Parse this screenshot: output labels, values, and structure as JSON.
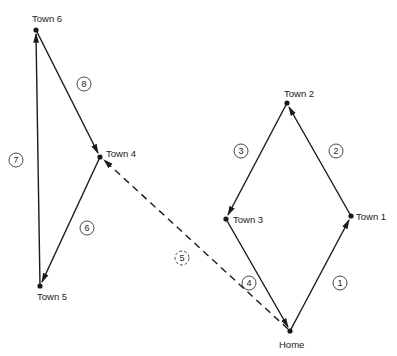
{
  "diagram": {
    "title": "",
    "colors": {
      "line": "#1a1a1a",
      "text": "#222222",
      "background": "#ffffff"
    },
    "nodes": [
      {
        "id": "home",
        "label": "Home",
        "x": 290,
        "y": 331
      },
      {
        "id": "town1",
        "label": "Town 1",
        "x": 351,
        "y": 216
      },
      {
        "id": "town2",
        "label": "Town 2",
        "x": 287,
        "y": 103
      },
      {
        "id": "town3",
        "label": "Town 3",
        "x": 226,
        "y": 219
      },
      {
        "id": "town4",
        "label": "Town 4",
        "x": 100,
        "y": 157
      },
      {
        "id": "town5",
        "label": "Town 5",
        "x": 40,
        "y": 286
      },
      {
        "id": "town6",
        "label": "Town 6",
        "x": 36,
        "y": 30
      }
    ],
    "edges": [
      {
        "step": "1",
        "from": "home",
        "to": "town1",
        "style": "solid"
      },
      {
        "step": "2",
        "from": "town1",
        "to": "town2",
        "style": "solid"
      },
      {
        "step": "3",
        "from": "town2",
        "to": "town3",
        "style": "solid"
      },
      {
        "step": "4",
        "from": "town3",
        "to": "home",
        "style": "solid"
      },
      {
        "step": "5",
        "from": "home",
        "to": "town4",
        "style": "dashed"
      },
      {
        "step": "6",
        "from": "town4",
        "to": "town5",
        "style": "solid"
      },
      {
        "step": "7",
        "from": "town5",
        "to": "town6",
        "style": "solid"
      },
      {
        "step": "8",
        "from": "town6",
        "to": "town4",
        "style": "solid"
      }
    ],
    "step_labels": {
      "s1": "1",
      "s2": "2",
      "s3": "3",
      "s4": "4",
      "s5": "5",
      "s6": "6",
      "s7": "7",
      "s8": "8"
    }
  }
}
